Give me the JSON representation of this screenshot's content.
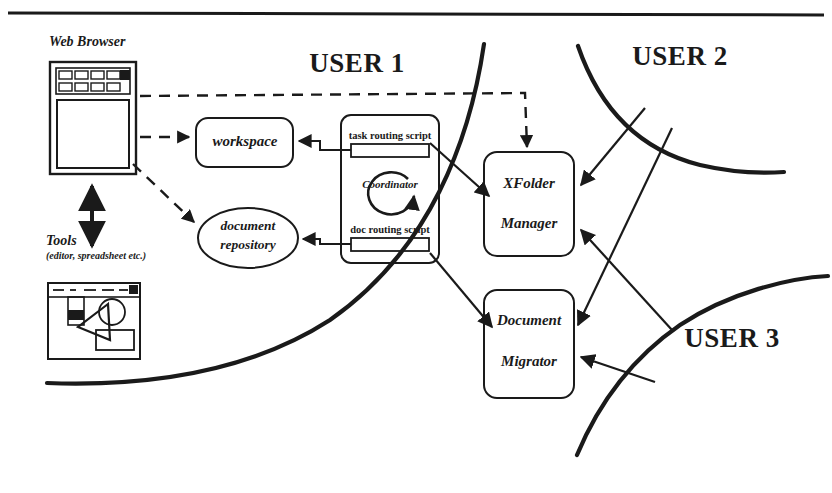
{
  "figure": {
    "title_rule": "top-horizontal-rule",
    "background": "#ffffff",
    "ink": "#1a1a1a"
  },
  "zones": {
    "user1": "USER 1",
    "user2": "USER 2",
    "user3": "USER 3"
  },
  "client": {
    "browser_caption": "Web Browser",
    "tools_caption": "Tools",
    "tools_subcaption": "(editor, spreadsheet etc.)"
  },
  "nodes": {
    "workspace": "workspace",
    "document_repository_line1": "document",
    "document_repository_line2": "repository",
    "coordinator": "Coordinator",
    "task_routing_script": "task routing script",
    "doc_routing_script": "doc routing script",
    "xfolder_manager_line1": "XFolder",
    "xfolder_manager_line2": "Manager",
    "document_migrator_line1": "Document",
    "document_migrator_line2": "Migrator"
  },
  "icons": {
    "browser": "web-browser-icon",
    "tools": "tools-window-icon",
    "double_arrow": "bidirectional-arrow-icon",
    "coordinator_cycle": "circular-arrow-icon"
  }
}
